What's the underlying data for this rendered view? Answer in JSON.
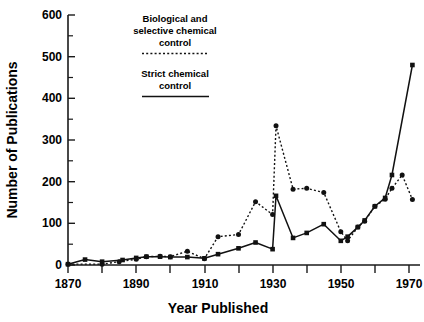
{
  "chart_data": {
    "type": "line",
    "title": "",
    "xlabel": "Year Published",
    "ylabel": "Number of Publications",
    "xlim": [
      1868,
      1974
    ],
    "ylim": [
      0,
      600
    ],
    "grid": false,
    "legend_position": "upper-center",
    "x_ticks_major": [
      1870,
      1890,
      1910,
      1930,
      1950,
      1970
    ],
    "x_ticks_minor": [
      1880,
      1900,
      1920,
      1940,
      1960
    ],
    "x_tick_labels": [
      "1870",
      "1890",
      "1910",
      "1930",
      "1950",
      "1970"
    ],
    "y_ticks_major": [
      0,
      100,
      200,
      300,
      400,
      500,
      600
    ],
    "y_ticks_minor": [
      50,
      150,
      250,
      350,
      450,
      550
    ],
    "y_tick_labels": [
      "0",
      "100",
      "200",
      "300",
      "400",
      "500",
      "600"
    ],
    "series": [
      {
        "name": "Biological and selective chemical control",
        "style": "dotted",
        "marker": "circle",
        "points": [
          {
            "x": 1870,
            "y": 2
          },
          {
            "x": 1880,
            "y": 2
          },
          {
            "x": 1885,
            "y": 8
          },
          {
            "x": 1890,
            "y": 14
          },
          {
            "x": 1893,
            "y": 20
          },
          {
            "x": 1897,
            "y": 21
          },
          {
            "x": 1900,
            "y": 20
          },
          {
            "x": 1905,
            "y": 33
          },
          {
            "x": 1910,
            "y": 15
          },
          {
            "x": 1914,
            "y": 68
          },
          {
            "x": 1920,
            "y": 73
          },
          {
            "x": 1925,
            "y": 152
          },
          {
            "x": 1930,
            "y": 121
          },
          {
            "x": 1931,
            "y": 334
          },
          {
            "x": 1936,
            "y": 182
          },
          {
            "x": 1940,
            "y": 184
          },
          {
            "x": 1945,
            "y": 174
          },
          {
            "x": 1950,
            "y": 80
          },
          {
            "x": 1952,
            "y": 58
          },
          {
            "x": 1955,
            "y": 91
          },
          {
            "x": 1957,
            "y": 105
          },
          {
            "x": 1960,
            "y": 141
          },
          {
            "x": 1963,
            "y": 158
          },
          {
            "x": 1965,
            "y": 184
          },
          {
            "x": 1968,
            "y": 216
          },
          {
            "x": 1971,
            "y": 157
          }
        ]
      },
      {
        "name": "Strict chemical control",
        "style": "solid",
        "marker": "square",
        "points": [
          {
            "x": 1870,
            "y": 2
          },
          {
            "x": 1875,
            "y": 13
          },
          {
            "x": 1880,
            "y": 8
          },
          {
            "x": 1886,
            "y": 12
          },
          {
            "x": 1890,
            "y": 17
          },
          {
            "x": 1893,
            "y": 20
          },
          {
            "x": 1897,
            "y": 20
          },
          {
            "x": 1900,
            "y": 19
          },
          {
            "x": 1905,
            "y": 19
          },
          {
            "x": 1910,
            "y": 16
          },
          {
            "x": 1914,
            "y": 26
          },
          {
            "x": 1920,
            "y": 40
          },
          {
            "x": 1925,
            "y": 54
          },
          {
            "x": 1930,
            "y": 38
          },
          {
            "x": 1931,
            "y": 166
          },
          {
            "x": 1936,
            "y": 65
          },
          {
            "x": 1940,
            "y": 77
          },
          {
            "x": 1945,
            "y": 98
          },
          {
            "x": 1950,
            "y": 58
          },
          {
            "x": 1952,
            "y": 68
          },
          {
            "x": 1955,
            "y": 91
          },
          {
            "x": 1957,
            "y": 107
          },
          {
            "x": 1960,
            "y": 141
          },
          {
            "x": 1963,
            "y": 161
          },
          {
            "x": 1965,
            "y": 216
          },
          {
            "x": 1971,
            "y": 480
          }
        ]
      }
    ],
    "annotations": [
      {
        "id": "legend-biological",
        "lines": [
          "Biological and",
          "selective chemical",
          "control"
        ],
        "swatch": "dotted"
      },
      {
        "id": "legend-strict",
        "lines": [
          "Strict chemical",
          "control"
        ],
        "swatch": "solid"
      }
    ]
  },
  "labels": {
    "y_axis_title": "Number of Publications",
    "x_axis_title": "Year Published",
    "legend_bio_line1": "Biological and",
    "legend_bio_line2": "selective chemical",
    "legend_bio_line3": "control",
    "legend_strict_line1": "Strict chemical",
    "legend_strict_line2": "control",
    "y0": "0",
    "y100": "100",
    "y200": "200",
    "y300": "300",
    "y400": "400",
    "y500": "500",
    "y600": "600",
    "x1870": "1870",
    "x1890": "1890",
    "x1910": "1910",
    "x1930": "1930",
    "x1950": "1950",
    "x1970": "1970"
  },
  "colors": {
    "ink": "#111111",
    "background": "#ffffff"
  }
}
